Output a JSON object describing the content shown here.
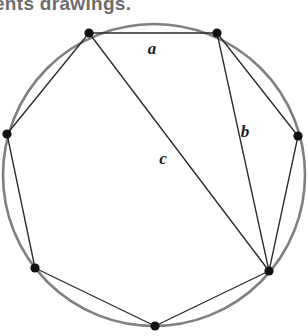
{
  "page": {
    "background_color": "#ffffff",
    "width": 308,
    "height": 336
  },
  "cut_off_header": {
    "text": "ents  drawings.",
    "color": "#6c6c6c"
  },
  "figure": {
    "circle": {
      "center_x": 154,
      "center_y": 175,
      "radius": 151,
      "stroke_color": "#808080",
      "stroke_width": 2.6
    },
    "chord_color": "#2b2b2b",
    "vertex_color": "#111111",
    "vertex_radius": 4.6,
    "vertices": [
      {
        "id": "v1",
        "name": "top-left",
        "x": 89,
        "y": 33
      },
      {
        "id": "v2",
        "name": "top-right",
        "x": 217,
        "y": 33
      },
      {
        "id": "v3",
        "name": "right",
        "x": 298,
        "y": 136
      },
      {
        "id": "v4",
        "name": "bottom-right",
        "x": 269,
        "y": 271
      },
      {
        "id": "v5",
        "name": "bottom",
        "x": 155,
        "y": 326
      },
      {
        "id": "v6",
        "name": "bottom-left",
        "x": 35,
        "y": 268
      },
      {
        "id": "v7",
        "name": "left",
        "x": 7,
        "y": 134
      }
    ],
    "chords": [
      {
        "id": "chord-a",
        "from": "v1",
        "to": "v2",
        "label": "a"
      },
      {
        "id": "chord-v2-v3",
        "from": "v2",
        "to": "v3",
        "label": ""
      },
      {
        "id": "chord-v3-v4",
        "from": "v3",
        "to": "v4",
        "label": ""
      },
      {
        "id": "chord-v4-v5",
        "from": "v4",
        "to": "v5",
        "label": ""
      },
      {
        "id": "chord-v5-v6",
        "from": "v5",
        "to": "v6",
        "label": ""
      },
      {
        "id": "chord-v6-v7",
        "from": "v6",
        "to": "v7",
        "label": ""
      },
      {
        "id": "chord-v7-v1",
        "from": "v7",
        "to": "v1",
        "label": ""
      },
      {
        "id": "chord-b",
        "from": "v2",
        "to": "v4",
        "label": "b"
      },
      {
        "id": "chord-c",
        "from": "v1",
        "to": "v4",
        "label": "c"
      }
    ],
    "labels": [
      {
        "id": "label-a",
        "text": "a",
        "x": 152,
        "y": 54
      },
      {
        "id": "label-b",
        "text": "b",
        "x": 245,
        "y": 137
      },
      {
        "id": "label-c",
        "text": "c",
        "x": 163,
        "y": 164
      }
    ]
  }
}
